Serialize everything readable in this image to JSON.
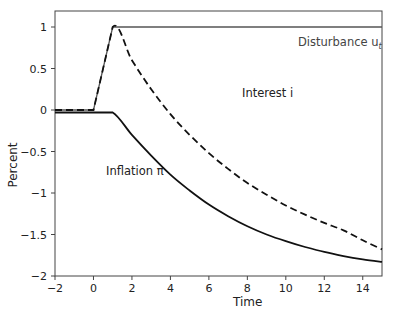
{
  "chart_data": {
    "type": "line",
    "title": "",
    "xlabel": "Time",
    "ylabel": "Percent",
    "xlim": [
      -2,
      15
    ],
    "ylim": [
      -2,
      1.2
    ],
    "grid": false,
    "legend": "none (inline annotations)",
    "x_ticks": [
      "-2",
      "0",
      "2",
      "4",
      "6",
      "8",
      "10",
      "12",
      "14"
    ],
    "y_ticks": [
      "1",
      "0.5",
      "0",
      "-0.5",
      "-1",
      "-1.5",
      "-2"
    ],
    "series": [
      {
        "name": "Disturbance u_t",
        "style": "solid thin",
        "x": [
          -2,
          0,
          1,
          15
        ],
        "y": [
          0,
          0,
          1,
          1
        ]
      },
      {
        "name": "Interest i",
        "style": "dashed",
        "x": [
          -2,
          0,
          1,
          2,
          3,
          4,
          5,
          6,
          7,
          8,
          9,
          10,
          11,
          12,
          13,
          14,
          15
        ],
        "y": [
          0,
          0,
          1,
          0.6,
          0.25,
          -0.05,
          -0.3,
          -0.52,
          -0.71,
          -0.88,
          -1.02,
          -1.15,
          -1.26,
          -1.36,
          -1.45,
          -1.57,
          -1.68
        ]
      },
      {
        "name": "Inflation π",
        "style": "solid thick",
        "x": [
          -2,
          0,
          1,
          2,
          3,
          4,
          5,
          6,
          7,
          8,
          9,
          10,
          11,
          12,
          13,
          14,
          15
        ],
        "y": [
          -0.03,
          -0.03,
          -0.03,
          -0.3,
          -0.55,
          -0.78,
          -0.97,
          -1.14,
          -1.28,
          -1.4,
          -1.5,
          -1.58,
          -1.65,
          -1.71,
          -1.76,
          -1.8,
          -1.83
        ]
      }
    ],
    "annotations": [
      {
        "text": "Disturbance u",
        "subscript": "t",
        "x": 10.5,
        "y": 0.8
      },
      {
        "text": "Interest i",
        "x": 6.5,
        "y": 0.35
      },
      {
        "text": "Inflation π",
        "x": 3.2,
        "y": -0.87
      }
    ]
  },
  "labels": {
    "xlabel": "Time",
    "ylabel": "Percent",
    "x_ticks": [
      "-2",
      "0",
      "2",
      "4",
      "6",
      "8",
      "10",
      "12",
      "14"
    ],
    "y_ticks": [
      "1",
      "0.5",
      "0",
      "-0.5",
      "-1",
      "-1.5",
      "-2"
    ],
    "disturbance": "Disturbance u",
    "disturbance_sub": "t",
    "interest": "Interest i",
    "inflation": "Inflation π"
  }
}
